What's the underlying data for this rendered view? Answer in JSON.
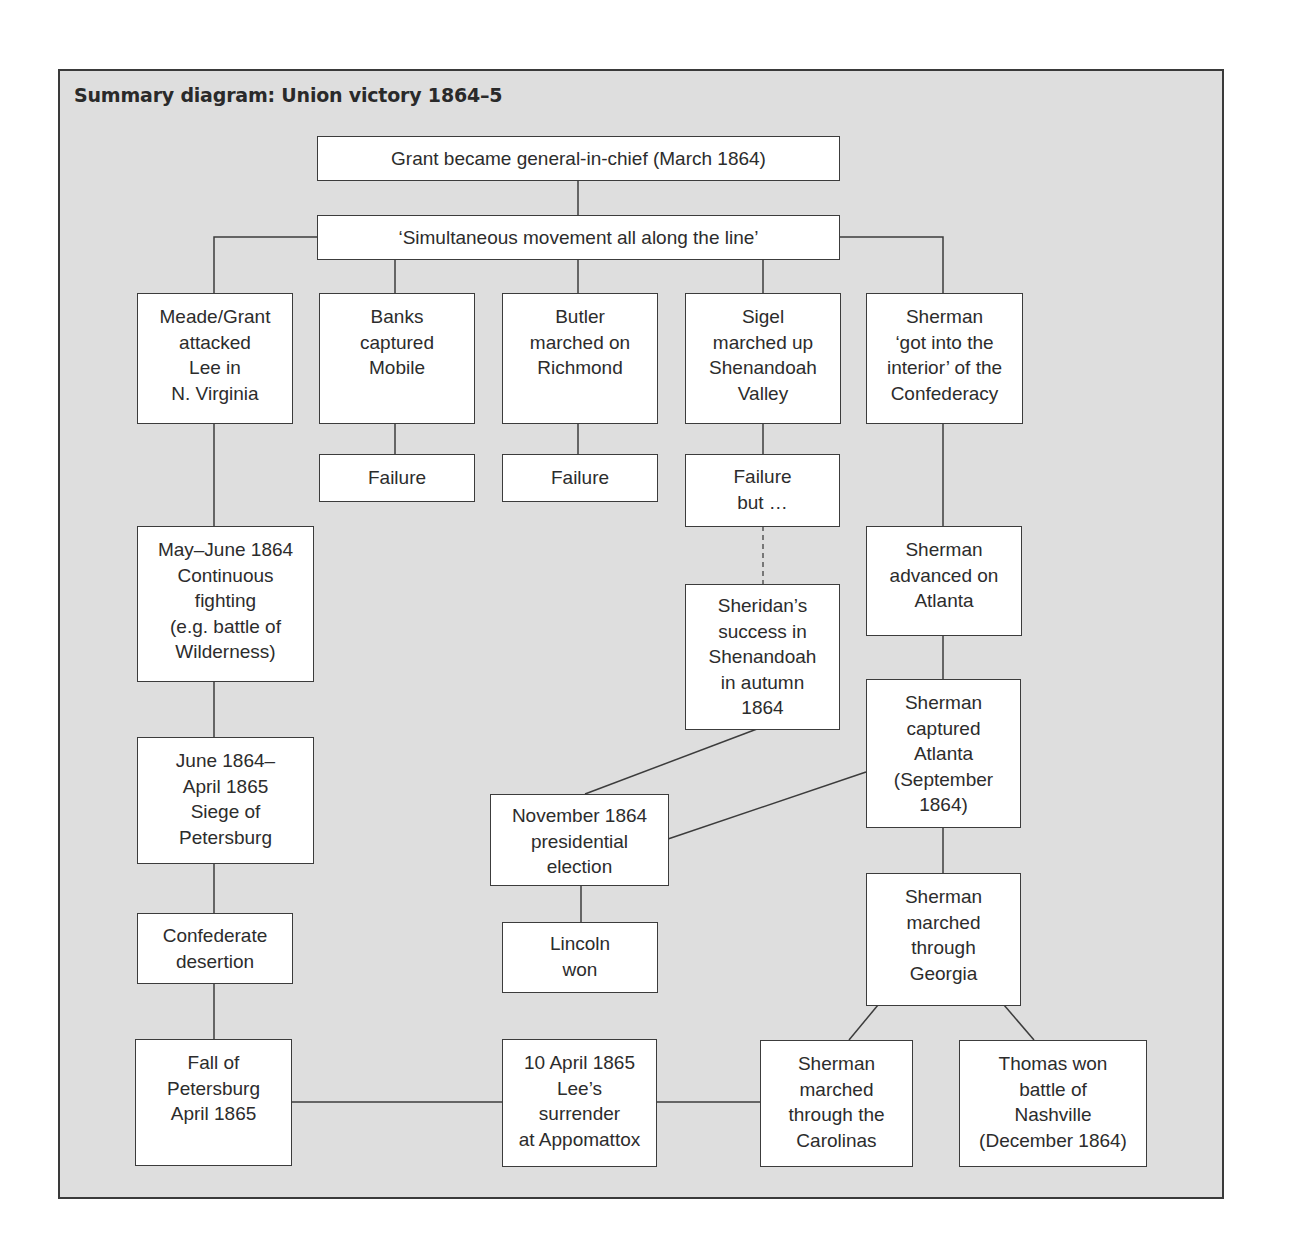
{
  "title": "Summary diagram: Union victory 1864–5",
  "nodes": {
    "grant": "Grant became general-in-chief (March 1864)",
    "simultaneous": "‘Simultaneous movement all along the line’",
    "meade": "Meade/Grant\nattacked\nLee in\nN. Virginia",
    "banks": "Banks\ncaptured\nMobile",
    "butler": "Butler\nmarched on\nRichmond",
    "sigel": "Sigel\nmarched up\nShenandoah\nValley",
    "sherman_interior": "Sherman\n‘got into the\ninterior’ of the\nConfederacy",
    "banks_failure": "Failure",
    "butler_failure": "Failure",
    "sigel_failure": "Failure\nbut …",
    "may_june": "May–June 1864\nContinuous\nfighting\n(e.g. battle of\nWilderness)",
    "sheridan": "Sheridan’s\nsuccess in\nShenandoah\nin autumn\n1864",
    "sherman_advanced": "Sherman\nadvanced on\nAtlanta",
    "siege": "June 1864–\nApril 1865\nSiege of\nPetersburg",
    "sherman_captured": "Sherman\ncaptured\nAtlanta\n(September\n1864)",
    "election": "November 1864\npresidential\nelection",
    "desertion": "Confederate\ndesertion",
    "lincoln": "Lincoln\nwon",
    "georgia": "Sherman\nmarched\nthrough\nGeorgia",
    "fall_petersburg": "Fall of\nPetersburg\nApril 1865",
    "surrender": "10 April 1865\nLee’s\nsurrender\nat Appomattox",
    "carolinas": "Sherman\nmarched\nthrough the\nCarolinas",
    "thomas": "Thomas won\nbattle of\nNashville\n(December 1864)"
  },
  "colors": {
    "background": "#dedede",
    "box_fill": "#ffffff",
    "line": "#3c3c3c"
  }
}
